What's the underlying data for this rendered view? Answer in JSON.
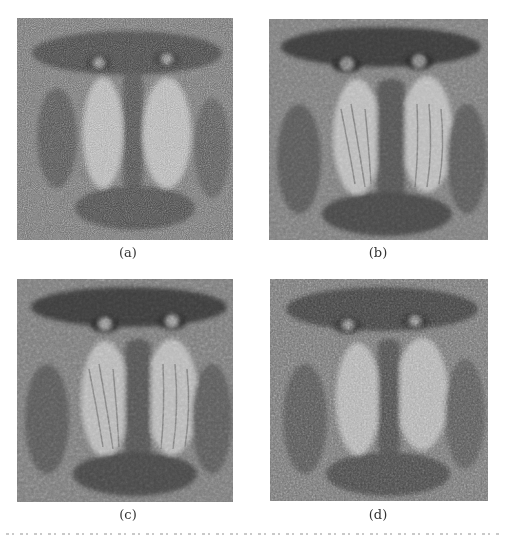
{
  "figure": {
    "type": "image-grid",
    "rows": 2,
    "cols": 2,
    "panels": [
      {
        "id": "a",
        "label": "(a)",
        "description": "Mandrill face, heavily noisy grayscale image",
        "noise_level": "high"
      },
      {
        "id": "b",
        "label": "(b)",
        "description": "Mandrill face, denoised result (smooth, clear features)",
        "noise_level": "low"
      },
      {
        "id": "c",
        "label": "(c)",
        "description": "Mandrill face, denoised result (smooth, clear features)",
        "noise_level": "low"
      },
      {
        "id": "d",
        "label": "(d)",
        "description": "Mandrill face, partially denoised result (residual grain)",
        "noise_level": "medium"
      }
    ],
    "caption": ""
  },
  "colors": {
    "background": "#ffffff",
    "image_mid_gray": "#7a7a7a",
    "image_dark": "#3a3a3a",
    "image_light": "#b8b8b8",
    "label_text": "#333333"
  }
}
